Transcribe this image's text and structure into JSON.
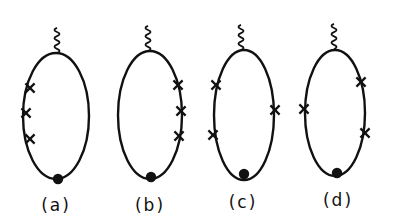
{
  "figure": {
    "type": "feynman-diagrams",
    "stroke_color": "#111111",
    "background": "#ffffff",
    "diagrams": [
      {
        "id": "a",
        "label": "(a)",
        "ellipse": {
          "cx": 56,
          "cy": 116,
          "rx": 33,
          "ry": 63
        },
        "photon_top": [
          57,
          53
        ],
        "vertex_dot": [
          58,
          179
        ],
        "crosses": [
          [
            30,
            88
          ],
          [
            26,
            113
          ],
          [
            30,
            139
          ]
        ],
        "label_pos": [
          56,
          211
        ]
      },
      {
        "id": "b",
        "label": "(b)",
        "ellipse": {
          "cx": 150,
          "cy": 115,
          "rx": 32,
          "ry": 64
        },
        "photon_top": [
          148,
          51
        ],
        "vertex_dot": [
          151,
          177
        ],
        "crosses": [
          [
            178,
            85
          ],
          [
            181,
            111
          ],
          [
            179,
            136
          ]
        ],
        "label_pos": [
          150,
          211
        ]
      },
      {
        "id": "c",
        "label": "(c)",
        "ellipse": {
          "cx": 244,
          "cy": 115,
          "rx": 30,
          "ry": 65
        },
        "photon_top": [
          241,
          50
        ],
        "vertex_dot": [
          244,
          174
        ],
        "crosses": [
          [
            216,
            85
          ],
          [
            213,
            135
          ],
          [
            275,
            110
          ]
        ],
        "label_pos": [
          243,
          208
        ]
      },
      {
        "id": "d",
        "label": "(d)",
        "ellipse": {
          "cx": 335,
          "cy": 113,
          "rx": 30,
          "ry": 63
        },
        "photon_top": [
          334,
          49
        ],
        "vertex_dot": [
          337,
          173
        ],
        "crosses": [
          [
            304,
            109
          ],
          [
            361,
            82
          ],
          [
            365,
            133
          ]
        ],
        "label_pos": [
          338,
          206
        ]
      }
    ]
  }
}
